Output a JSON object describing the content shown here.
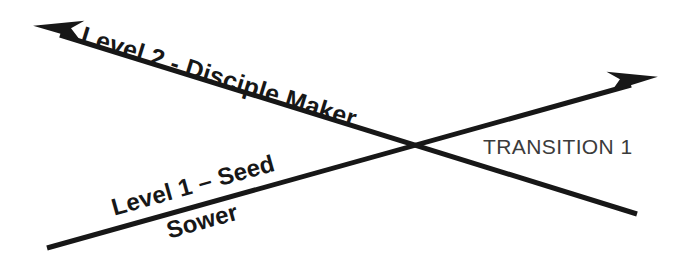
{
  "diagram": {
    "type": "crossing-arrows",
    "background_color": "#ffffff",
    "stroke_color": "#171717",
    "labels": {
      "level_two": "Level 2 - Disciple Maker",
      "level_one": "Level 1 – Seed",
      "level_one_second_line": "Sower",
      "transition": "TRANSITION 1"
    },
    "arrows": [
      {
        "name": "level-one-arrow",
        "label": "Level 1 – Seed Sower",
        "from": [
          47,
          248
        ],
        "to": [
          658,
          78
        ],
        "arrowhead_at": "end",
        "direction": "up-right",
        "angle_deg": -15.6,
        "stroke_width": 5,
        "color": "#171717"
      },
      {
        "name": "level-two-arrow",
        "label": "Level 2 - Disciple Maker",
        "from": [
          637,
          214
        ],
        "to": [
          33,
          27
        ],
        "arrowhead_at": "end",
        "direction": "up-left",
        "angle_deg": 17.2,
        "stroke_width": 5,
        "color": "#171717"
      }
    ],
    "crossing_point": [
      412,
      145
    ],
    "text_colors": {
      "level_labels": "#171717",
      "transition_label": "#3b3b3b"
    }
  }
}
